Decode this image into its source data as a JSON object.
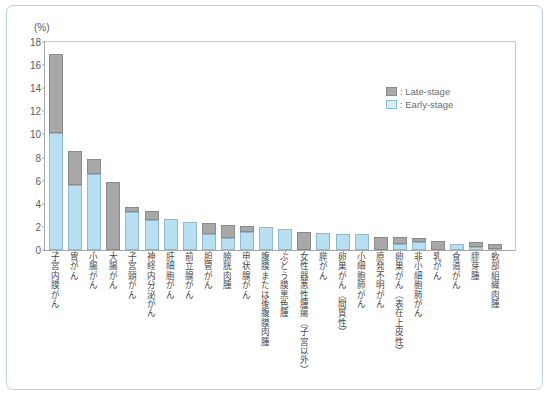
{
  "axis": {
    "unit_label": "(%)",
    "y_ticks": [
      "0",
      "2",
      "4",
      "6",
      "8",
      "10",
      "12",
      "14",
      "16",
      "18"
    ]
  },
  "legend": {
    "items": [
      {
        "label": ": Late-stage",
        "color": "#a8a8a8",
        "key": "late"
      },
      {
        "label": ": Early-stage",
        "color": "#d8eef9",
        "key": "early"
      }
    ]
  },
  "chart_data": {
    "type": "bar",
    "title": "",
    "subtitle": "",
    "xlabel": "",
    "ylabel": "(%)",
    "ylim": [
      0,
      18
    ],
    "grid": false,
    "stacked": true,
    "legend_position": "top-right",
    "categories": [
      "子宮内膜がん",
      "胃がん",
      "小腸がん",
      "大腸がん",
      "子宮頸がん",
      "神経内分泌がん",
      "肝細胞がん",
      "前立腺がん",
      "胆管がん",
      "膀胱肉腫",
      "甲状腺がん",
      "腹膜または後腹膜肉腫",
      "ぶどう膜黒色腫",
      "女性器悪性腫瘍（子宮以外）",
      "膵がん",
      "卵巣がん（間質性）",
      "小細胞肺がん",
      "原発不明がん",
      "卵巣がん（表在上皮性）",
      "非小細胞肺がん",
      "乳がん",
      "食道がん",
      "膠芽腫",
      "軟部組織肉腫"
    ],
    "series": [
      {
        "name": "Early-stage",
        "color": "#b8dff2",
        "values": [
          10.1,
          5.6,
          6.6,
          0.0,
          3.3,
          2.6,
          2.7,
          2.4,
          1.4,
          1.0,
          1.6,
          2.0,
          1.8,
          0.0,
          1.5,
          1.4,
          1.4,
          0.0,
          0.5,
          0.7,
          0.0,
          0.5,
          0.3,
          0.1
        ]
      },
      {
        "name": "Late-stage",
        "color": "#a8a8a8",
        "values": [
          6.9,
          3.0,
          1.3,
          5.9,
          0.4,
          0.8,
          0.0,
          0.0,
          0.9,
          1.2,
          0.5,
          0.0,
          0.0,
          1.6,
          0.0,
          0.0,
          0.0,
          1.1,
          0.6,
          0.3,
          0.8,
          0.0,
          0.4,
          0.4
        ]
      }
    ],
    "totals": [
      17.0,
      8.6,
      7.9,
      5.9,
      3.7,
      3.4,
      2.7,
      2.4,
      2.3,
      2.2,
      2.1,
      2.0,
      1.8,
      1.6,
      1.5,
      1.4,
      1.4,
      1.1,
      1.1,
      1.0,
      0.8,
      0.5,
      0.7,
      0.5
    ]
  }
}
